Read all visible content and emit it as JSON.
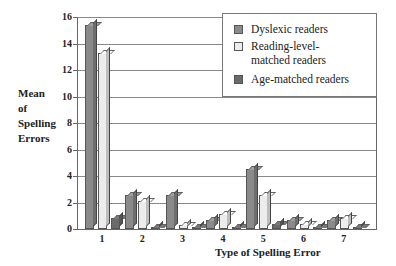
{
  "chart_data": {
    "type": "bar",
    "title": "",
    "xlabel": "Type of Spelling Error",
    "ylabel": "Mean of Spelling Errors",
    "ylabel_lines": [
      "Mean",
      "of",
      "Spelling",
      "Errors"
    ],
    "ylim": [
      0,
      16
    ],
    "yticks": [
      "0",
      "2",
      "4",
      "6",
      "8",
      "10",
      "12",
      "14",
      "16"
    ],
    "categories": [
      "1",
      "2",
      "3",
      "4",
      "5",
      "6",
      "7"
    ],
    "grid": true,
    "legend_position": "upper right",
    "series": [
      {
        "name": "Dyslexic readers",
        "color": "#8a8a8a",
        "values": [
          15.4,
          2.6,
          2.6,
          0.7,
          4.5,
          0.7,
          0.7
        ]
      },
      {
        "name": "Reading-level-matched readers",
        "color": "#ececec",
        "values": [
          13.3,
          2.1,
          0.3,
          1.1,
          2.6,
          0.4,
          0.8
        ]
      },
      {
        "name": "Age-matched readers",
        "color": "#6a6a6a",
        "values": [
          0.8,
          0.1,
          0.05,
          0.05,
          0.4,
          0.1,
          0.1
        ]
      }
    ]
  },
  "legend": {
    "items": [
      {
        "label_lines": [
          "Dyslexic readers"
        ]
      },
      {
        "label_lines": [
          "Reading-level-",
          "matched readers"
        ]
      },
      {
        "label_lines": [
          "Age-matched readers"
        ]
      }
    ]
  }
}
